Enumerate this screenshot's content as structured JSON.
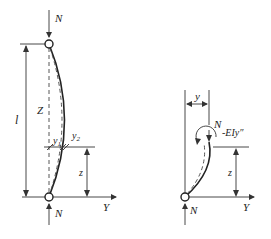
{
  "figure": {
    "left_panel": {
      "top_force_label": "N",
      "bottom_force_label": "N",
      "length_label": "l",
      "axis_z_label": "Z",
      "axis_y_label": "Y",
      "deflection_1_label": "y",
      "deflection_1_subscript": "1",
      "deflection_2_label": "y",
      "deflection_2_subscript": "2",
      "height_label": "z"
    },
    "right_panel": {
      "deflection_label": "y",
      "section_force_label": "N",
      "moment_label": "-EIy″",
      "height_label": "z",
      "bottom_force_label": "N",
      "axis_y_label": "Y"
    }
  }
}
